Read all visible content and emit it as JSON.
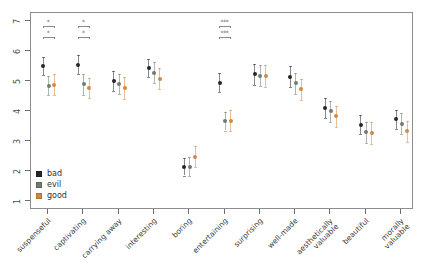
{
  "chart_data": {
    "type": "scatter",
    "title": "",
    "subtitle": "",
    "xlabel": "",
    "ylabel": "",
    "ylim": [
      1,
      7
    ],
    "yticks": [
      1,
      2,
      3,
      4,
      5,
      6,
      7
    ],
    "ytick_labels": [
      "1",
      "2",
      "3",
      "4",
      "5",
      "6",
      "7"
    ],
    "grid": false,
    "legend_position": "inside-bottom-left",
    "error_bars": "confidence interval (vertical whiskers with caps)",
    "categories": [
      "suspenseful",
      "captivating",
      "carrying away",
      "interesting",
      "boring",
      "entertaining",
      "surprising",
      "well-made",
      "aesthetically\nvaluable",
      "beautiful",
      "morally\nvaluable"
    ],
    "series": [
      {
        "name": "bad",
        "color": "#262626",
        "values": [
          5.5,
          5.55,
          4.99,
          5.45,
          2.14,
          4.95,
          5.22,
          5.15,
          4.1,
          3.55,
          3.72
        ],
        "ci_low": [
          5.2,
          5.22,
          4.66,
          5.15,
          1.85,
          4.62,
          4.88,
          4.8,
          3.78,
          3.22,
          3.4
        ],
        "ci_high": [
          5.8,
          5.88,
          5.32,
          5.75,
          2.43,
          5.28,
          5.56,
          5.5,
          4.42,
          3.88,
          4.04
        ]
      },
      {
        "name": "evil",
        "color": "#6e7d6e",
        "values": [
          4.85,
          4.9,
          4.89,
          5.27,
          2.14,
          3.66,
          5.18,
          4.92,
          4.0,
          3.3,
          3.58
        ],
        "ci_low": [
          4.52,
          4.55,
          4.56,
          4.92,
          1.82,
          3.35,
          4.82,
          4.58,
          3.65,
          2.95,
          3.22
        ],
        "ci_high": [
          5.18,
          5.25,
          5.22,
          5.62,
          2.46,
          3.97,
          5.54,
          5.26,
          4.35,
          3.65,
          3.94
        ]
      },
      {
        "name": "good",
        "color": "#d4883f",
        "values": [
          4.88,
          4.76,
          4.76,
          5.08,
          2.48,
          3.68,
          5.17,
          4.72,
          3.83,
          3.26,
          3.32
        ],
        "ci_low": [
          4.52,
          4.42,
          4.4,
          4.72,
          2.12,
          3.34,
          4.8,
          4.36,
          3.48,
          2.9,
          2.96
        ],
        "ci_high": [
          5.24,
          5.1,
          5.12,
          5.44,
          2.84,
          4.02,
          5.54,
          5.08,
          4.18,
          3.62,
          3.68
        ]
      }
    ],
    "significance_annotations": [
      {
        "category": "suspenseful",
        "marks": [
          "*",
          "*"
        ]
      },
      {
        "category": "captivating",
        "marks": [
          "*",
          "*"
        ]
      },
      {
        "category": "entertaining",
        "marks": [
          "***",
          "***"
        ]
      }
    ]
  },
  "legend": {
    "items": [
      {
        "label": "bad",
        "color": "#262626"
      },
      {
        "label": "evil",
        "color": "#6e7d6e"
      },
      {
        "label": "good",
        "color": "#d4883f"
      }
    ]
  }
}
